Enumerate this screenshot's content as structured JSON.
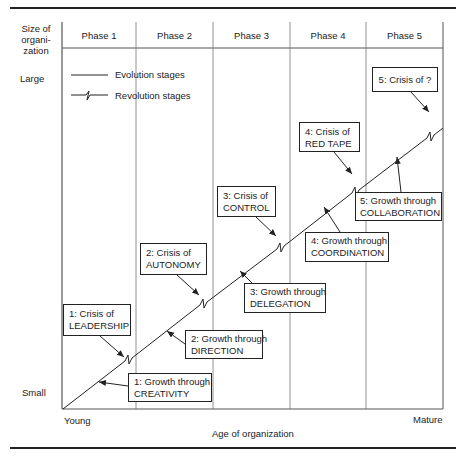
{
  "yaxis": {
    "title": "Size of organi-zation",
    "title_lines": [
      "Size of",
      "organi-",
      "zation"
    ],
    "top_label": "Large",
    "bottom_label": "Small"
  },
  "xaxis": {
    "start_label": "Young",
    "end_label": "Mature",
    "title": "Age of organization"
  },
  "phases": [
    "Phase 1",
    "Phase 2",
    "Phase 3",
    "Phase 4",
    "Phase 5"
  ],
  "legend": {
    "evolution": "Evolution stages",
    "revolution": "Revolution stages"
  },
  "crises": [
    {
      "line1": "1: Crisis of",
      "line2": "LEADERSHIP"
    },
    {
      "line1": "2: Crisis of",
      "line2": "AUTONOMY"
    },
    {
      "line1": "3: Crisis of",
      "line2": "CONTROL"
    },
    {
      "line1": "4: Crisis of",
      "line2": "RED TAPE"
    },
    {
      "line1": "5: Crisis of ?",
      "line2": ""
    }
  ],
  "growths": [
    {
      "line1": "1: Growth through",
      "line2": "CREATIVITY"
    },
    {
      "line1": "2: Growth through",
      "line2": "DIRECTION"
    },
    {
      "line1": "3: Growth through",
      "line2": "DELEGATION"
    },
    {
      "line1": "4: Growth through",
      "line2": "COORDINATION"
    },
    {
      "line1": "5: Growth through",
      "line2": "COLLABORATION"
    }
  ]
}
